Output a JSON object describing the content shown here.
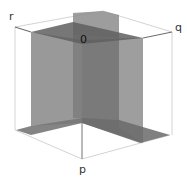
{
  "diagram": {
    "title": "",
    "axes": {
      "r": {
        "label": "r"
      },
      "q": {
        "label": "q"
      },
      "p": {
        "label": "p"
      }
    },
    "origin": {
      "label": "0"
    },
    "colors": {
      "plane_dark": "#6f6f6f",
      "plane_mid": "#8a8a8a",
      "plane_light": "#a3a3a3",
      "cube_edge": "#d2d2d2",
      "axis_line": "#7a7a7a",
      "background": "#ffffff"
    }
  }
}
